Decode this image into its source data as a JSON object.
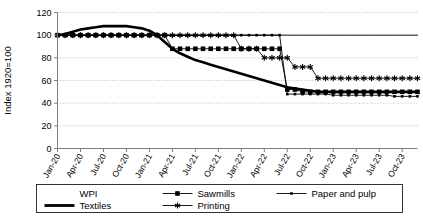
{
  "chart_data": {
    "type": "line",
    "title": "",
    "xlabel": "",
    "ylabel": "Index 1920=100",
    "ylim": [
      0,
      120
    ],
    "yticks": [
      0,
      20,
      40,
      60,
      80,
      100,
      120
    ],
    "grid": true,
    "legend_position": "bottom",
    "categories": [
      "Jan-20",
      "Feb-20",
      "Mar-20",
      "Apr-20",
      "May-20",
      "Jun-20",
      "Jul-20",
      "Aug-20",
      "Sep-20",
      "Oct-20",
      "Nov-20",
      "Dec-20",
      "Jan-21",
      "Feb-21",
      "Mar-21",
      "Apr-21",
      "May-21",
      "Jun-21",
      "Jul-21",
      "Aug-21",
      "Sep-21",
      "Oct-21",
      "Nov-21",
      "Dec-21",
      "Jan-22",
      "Feb-22",
      "Mar-22",
      "Apr-22",
      "May-22",
      "Jun-22",
      "Jul-22",
      "Aug-22",
      "Sep-22",
      "Oct-22",
      "Nov-22",
      "Dec-22",
      "Jan-23",
      "Feb-23",
      "Mar-23",
      "Apr-23",
      "May-23",
      "Jun-23",
      "Jul-23",
      "Aug-23",
      "Sep-23",
      "Oct-23",
      "Nov-23",
      "Dec-23"
    ],
    "xtick_labels": [
      "Jan-20",
      "Apr-20",
      "Jul-20",
      "Oct-20",
      "Jan-21",
      "Apr-21",
      "Jul-21",
      "Oct-21",
      "Jan-22",
      "Apr-22",
      "Jul-22",
      "Oct-22",
      "Jan-23",
      "Apr-23",
      "Jul-23",
      "Oct-23"
    ],
    "xtick_indices": [
      0,
      3,
      6,
      9,
      12,
      15,
      18,
      21,
      24,
      27,
      30,
      33,
      36,
      39,
      42,
      45
    ],
    "series": [
      {
        "name": "WPI",
        "marker": "none",
        "style": "thin-line",
        "color": "#000000",
        "values": [
          100,
          100,
          100,
          100,
          100,
          100,
          100,
          100,
          100,
          100,
          100,
          100,
          100,
          100,
          100,
          100,
          100,
          100,
          100,
          100,
          100,
          100,
          100,
          100,
          100,
          100,
          100,
          100,
          100,
          100,
          100,
          100,
          100,
          100,
          100,
          100,
          100,
          100,
          100,
          100,
          100,
          100,
          100,
          100,
          100,
          100,
          100,
          100
        ]
      },
      {
        "name": "Textiles",
        "marker": "none",
        "style": "thick-line",
        "color": "#000000",
        "values": [
          100,
          101,
          103,
          105,
          106,
          107,
          108,
          108,
          108,
          108,
          107,
          106,
          104,
          100,
          94,
          88,
          84,
          81,
          78,
          76,
          74,
          72,
          70,
          68,
          66,
          64,
          62,
          60,
          58,
          56,
          54,
          53,
          52,
          51,
          50,
          50,
          50,
          50,
          50,
          50,
          50,
          50,
          50,
          50,
          50,
          50,
          50,
          50
        ]
      },
      {
        "name": "Sawmills",
        "marker": "square",
        "style": "marker-line",
        "color": "#000000",
        "values": [
          100,
          100,
          100,
          100,
          100,
          100,
          100,
          100,
          100,
          100,
          100,
          100,
          100,
          100,
          100,
          88,
          88,
          88,
          88,
          88,
          88,
          88,
          88,
          88,
          88,
          88,
          88,
          88,
          88,
          88,
          52,
          52,
          50,
          50,
          50,
          50,
          50,
          50,
          50,
          50,
          50,
          50,
          50,
          50,
          50,
          50,
          50,
          50
        ]
      },
      {
        "name": "Printing",
        "marker": "star",
        "style": "marker-line",
        "color": "#000000",
        "values": [
          100,
          100,
          100,
          100,
          100,
          100,
          100,
          100,
          100,
          100,
          100,
          100,
          100,
          100,
          100,
          100,
          100,
          100,
          100,
          100,
          100,
          100,
          100,
          100,
          88,
          88,
          88,
          80,
          80,
          80,
          80,
          72,
          72,
          72,
          62,
          62,
          62,
          62,
          62,
          62,
          62,
          62,
          62,
          62,
          62,
          62,
          62,
          62
        ]
      },
      {
        "name": "Paper and pulp",
        "marker": "small-square",
        "style": "marker-line",
        "color": "#000000",
        "values": [
          100,
          100,
          100,
          100,
          100,
          100,
          100,
          100,
          100,
          100,
          100,
          100,
          100,
          100,
          100,
          100,
          100,
          100,
          100,
          100,
          100,
          100,
          100,
          100,
          100,
          100,
          100,
          100,
          100,
          100,
          48,
          48,
          48,
          48,
          48,
          48,
          47,
          47,
          47,
          47,
          47,
          47,
          47,
          47,
          46,
          46,
          46,
          46
        ]
      }
    ],
    "legend": [
      {
        "label": "WPI",
        "marker": "none",
        "style": "thin-line"
      },
      {
        "label": "Sawmills",
        "marker": "square",
        "style": "marker-line"
      },
      {
        "label": "Paper and pulp",
        "marker": "small-square",
        "style": "marker-line"
      },
      {
        "label": "Textiles",
        "marker": "none",
        "style": "thick-line"
      },
      {
        "label": "Printing",
        "marker": "star",
        "style": "marker-line"
      }
    ]
  }
}
